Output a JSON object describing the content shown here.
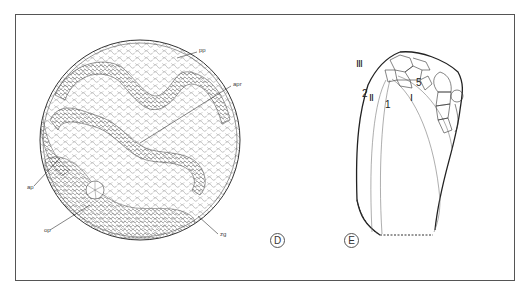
{
  "figure": {
    "panels": [
      {
        "id": "D",
        "label": "D",
        "labels": {
          "pp": "pp",
          "apr": "apr",
          "ap": "ap",
          "op": "op",
          "zg": "zg"
        }
      },
      {
        "id": "E",
        "label": "E",
        "labels": {
          "III": "Ⅲ",
          "II": "Ⅱ",
          "I": "Ⅰ",
          "n2": "2",
          "n1": "1",
          "n5": "5"
        }
      }
    ]
  }
}
